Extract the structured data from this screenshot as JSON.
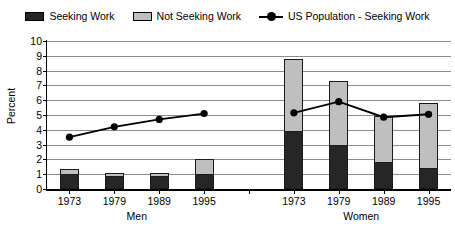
{
  "chart_data": {
    "type": "bar",
    "title": "",
    "subtitle": "",
    "xlabel": "",
    "ylabel": "Percent",
    "ylim": [
      0,
      10
    ],
    "ytick_labels": [
      "0",
      "1",
      "2",
      "3",
      "4",
      "5",
      "6",
      "7",
      "8",
      "9",
      "10"
    ],
    "grid": true,
    "legend_position": "top-center",
    "stacked": true,
    "groups": [
      {
        "name": "Men",
        "categories": [
          "1973",
          "1979",
          "1989",
          "1995"
        ]
      },
      {
        "name": "Women",
        "categories": [
          "1973",
          "1979",
          "1989",
          "1995"
        ]
      }
    ],
    "categories": [
      "1973",
      "1979",
      "1989",
      "1995",
      "1973",
      "1979",
      "1989",
      "1995"
    ],
    "series": [
      {
        "name": "Seeking Work",
        "type": "bar",
        "color": "#262626",
        "values": [
          1.0,
          0.85,
          0.85,
          1.0,
          3.9,
          3.0,
          1.8,
          1.4
        ]
      },
      {
        "name": "Not Seeking Work",
        "type": "bar",
        "color": "#bfbfbf",
        "values": [
          0.35,
          0.25,
          0.25,
          1.0,
          4.9,
          4.3,
          3.1,
          4.4
        ]
      },
      {
        "name": "US Population - Seeking Work",
        "type": "line",
        "color": "#000000",
        "values": [
          3.5,
          4.2,
          4.7,
          5.1,
          5.15,
          5.9,
          4.85,
          5.05
        ],
        "breaks_between_groups": true
      }
    ],
    "totals": [
      1.35,
      1.1,
      1.1,
      2.0,
      8.8,
      7.3,
      4.9,
      5.8
    ]
  },
  "legend": {
    "items": [
      {
        "label": "Seeking Work",
        "marker": "square-dark",
        "color": "#262626"
      },
      {
        "label": "Not Seeking Work",
        "marker": "square-light",
        "color": "#bfbfbf"
      },
      {
        "label": "US Population - Seeking Work",
        "marker": "line-dot",
        "color": "#000000"
      }
    ]
  },
  "axes": {
    "y": {
      "title": "Percent",
      "ticks": [
        "0",
        "1",
        "2",
        "3",
        "4",
        "5",
        "6",
        "7",
        "8",
        "9",
        "10"
      ]
    },
    "x": {
      "ticks": [
        "1973",
        "1979",
        "1989",
        "1995",
        "1973",
        "1979",
        "1989",
        "1995"
      ],
      "group_labels": [
        "Men",
        "Women"
      ]
    }
  },
  "colors": {
    "seeking_work": "#262626",
    "not_seeking_work": "#bfbfbf",
    "line": "#000000",
    "gridline": "#8c8c8c",
    "axis": "#000000",
    "background": "#ffffff"
  }
}
